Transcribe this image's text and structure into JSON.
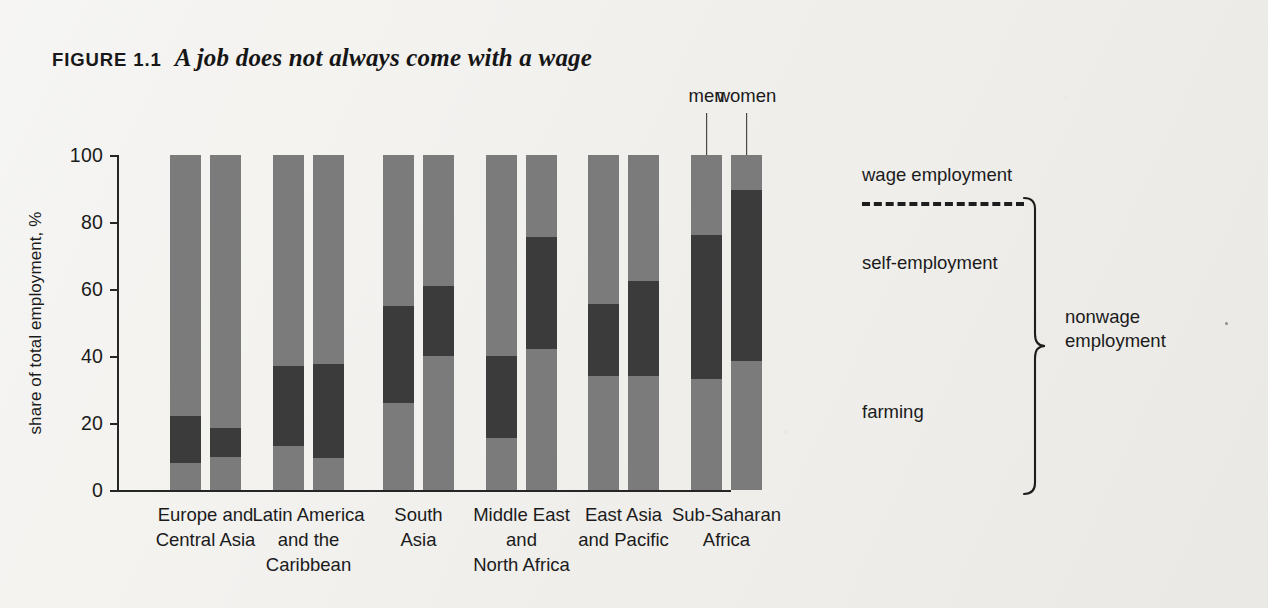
{
  "figure": {
    "label": "FIGURE 1.1",
    "title": "A job does not always come with a wage"
  },
  "axes": {
    "y_title": "share of total employment, %",
    "y_ticks": [
      "100",
      "80",
      "60",
      "40",
      "20",
      "0"
    ]
  },
  "callouts": {
    "men": "men",
    "women": "women"
  },
  "legend": {
    "wage": "wage employment",
    "self": "self-employment",
    "farming": "farming",
    "nonwage": "nonwage\nemployment"
  },
  "colors": {
    "farming": "#7b7b7b",
    "self_employment": "#3b3b3b",
    "wage_employment": "#7b7b7b",
    "page_background": "#efeeea",
    "axis": "#262626",
    "text": "#1b1b1b"
  },
  "categories": [
    "Europe and\nCentral Asia",
    "Latin America\nand the\nCaribbean",
    "South\nAsia",
    "Middle East\nand\nNorth Africa",
    "East Asia\nand Pacific",
    "Sub-Saharan\nAfrica"
  ],
  "chart_data": {
    "type": "bar",
    "subtype": "grouped stacked (men / women per region)",
    "title": "A job does not always come with a wage",
    "xlabel": "",
    "ylabel": "share of total employment, %",
    "ylim": [
      0,
      100
    ],
    "yticks": [
      0,
      20,
      40,
      60,
      80,
      100
    ],
    "grid": false,
    "legend_position": "right",
    "stack_order_bottom_to_top": [
      "farming",
      "self-employment",
      "wage employment"
    ],
    "categories": [
      "Europe and Central Asia",
      "Latin America and the Caribbean",
      "South Asia",
      "Middle East and North Africa",
      "East Asia and Pacific",
      "Sub-Saharan Africa"
    ],
    "groups": [
      "men",
      "women"
    ],
    "series": [
      {
        "name": "farming",
        "men": [
          8,
          13,
          26,
          15.5,
          34,
          33
        ],
        "women": [
          10,
          9.5,
          40,
          42,
          34,
          38.5
        ]
      },
      {
        "name": "self-employment",
        "men": [
          14,
          24,
          29,
          24.5,
          21.5,
          43
        ],
        "women": [
          8.5,
          28,
          21,
          33.5,
          28.5,
          51
        ]
      },
      {
        "name": "wage employment",
        "men": [
          78,
          63,
          45,
          60,
          44.5,
          24
        ],
        "women": [
          81.5,
          62.5,
          39,
          24.5,
          37.5,
          10.5
        ]
      }
    ],
    "cumulative_tops": {
      "men": {
        "farming": [
          8,
          13,
          26,
          15.5,
          34,
          33
        ],
        "self_employment": [
          22,
          37,
          55,
          40,
          55.5,
          76
        ],
        "wage_employment": [
          100,
          100,
          100,
          100,
          100,
          100
        ]
      },
      "women": {
        "farming": [
          10,
          9.5,
          40,
          42,
          34,
          38.5
        ],
        "self_employment": [
          18.5,
          37.5,
          61,
          75.5,
          62.5,
          89.5
        ],
        "wage_employment": [
          100,
          100,
          100,
          100,
          100,
          100
        ]
      }
    },
    "annotations": [
      "men",
      "women",
      "wage employment",
      "self-employment",
      "farming",
      "nonwage employment"
    ]
  }
}
